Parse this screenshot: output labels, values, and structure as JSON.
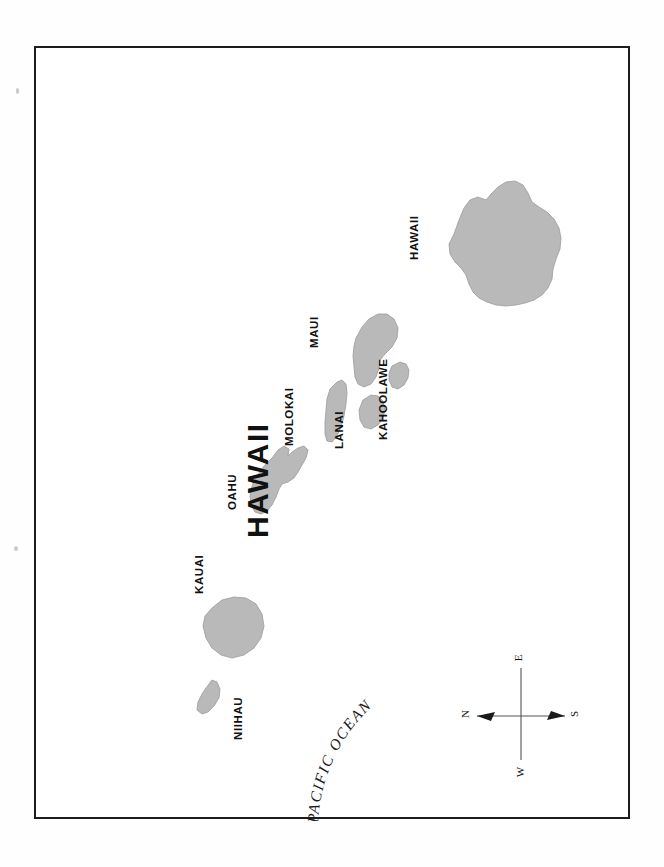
{
  "document": {
    "kind": "reference-map",
    "title": "HAWAII",
    "background_color": "#ffffff",
    "border_color": "#1c1c1c",
    "island_fill_color": "#b9b9b9",
    "text_color": "#111111"
  },
  "map": {
    "title": "HAWAII",
    "ocean_label": "PACIFIC OCEAN",
    "orientation_note": "sheet rotated 90 degrees counter-clockwise",
    "islands": [
      {
        "name": "NIIHAU"
      },
      {
        "name": "KAUAI"
      },
      {
        "name": "OAHU"
      },
      {
        "name": "MOLOKAI"
      },
      {
        "name": "LANAI"
      },
      {
        "name": "MAUI"
      },
      {
        "name": "KAHOOLAWE"
      },
      {
        "name": "HAWAII"
      }
    ]
  },
  "compass": {
    "name": "compass-rose",
    "north": "N",
    "east": "E",
    "south": "S",
    "west": "W"
  }
}
